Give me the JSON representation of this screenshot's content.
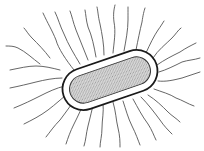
{
  "figure": {
    "subject": "peritrichous bacterium",
    "colors": {
      "background": "#ffffff",
      "outline": "#1a1a1a",
      "flagella": "#555555",
      "cytoplasm_fill": "#cfcfcf",
      "capsule_fill": "#ffffff"
    },
    "cell": {
      "center": [
        110,
        80
      ],
      "rotation_deg": -19,
      "outer_length": 98,
      "outer_width": 42,
      "inner_length": 84,
      "inner_width": 28
    },
    "flagella": [
      "M74 70 C66 60 58 48 56 40 C52 30 48 24 43 13",
      "M80 64 C74 54 68 44 64 34 C60 26 58 18 55 12",
      "M88 60 C84 50 80 40 76 30 C73 22 72 16 70 11",
      "M96 57 C94 46 92 36 88 27 C86 20 86 15 85 10",
      "M104 55 C104 44 102 34 100 24 C98 16 98 11 97 7",
      "M113 53 C114 42 116 32 114 22 C113 14 114 9 115 5",
      "M124 51 C126 40 128 30 128 20 C128 14 128 10 128 7",
      "M136 50 C138 40 140 30 142 22 C143 15 144 11 145 8",
      "M146 53 C150 44 154 36 158 30 C161 26 162 24 164 21",
      "M153 58 C158 50 166 44 172 38 C176 34 178 30 181 28",
      "M157 65 C164 60 172 56 180 52 C186 48 190 46 196 43",
      "M159 72 C166 70 174 66 182 62 C188 60 194 60 200 58",
      "M158 81 C166 82 174 80 182 78 C188 76 194 74 200 72",
      "M154 89 C162 92 170 94 176 98 C182 100 188 104 194 106",
      "M148 95 C156 100 162 106 168 112 C172 116 176 118 180 122",
      "M60 70 C52 68 44 66 36 66 C28 66 20 68 10 70",
      "M62 78 C54 78 44 80 36 82 C28 84 20 86 10 88",
      "M65 86 C56 88 48 92 40 96 C32 100 24 104 14 108",
      "M70 92 C62 98 56 104 48 110 C40 116 32 120 24 124",
      "M77 96 C72 104 66 112 60 120 C54 126 50 132 46 137",
      "M85 99 C82 108 78 116 74 124 C70 132 68 138 66 144",
      "M94 101 C92 110 90 118 88 126 C86 134 86 140 84 146",
      "M103 103 C104 112 102 120 102 128 C102 136 100 142 100 147",
      "M113 102 C116 112 116 120 118 128 C120 136 120 142 120 147",
      "M123 101 C126 110 128 118 132 126 C136 134 138 140 140 145",
      "M133 99 C138 108 142 116 148 124 C152 130 154 136 156 140",
      "M141 97 C148 104 154 112 160 120 C164 126 168 130 172 134",
      "M40 64 C32 58 26 52 18 48 C14 46 10 46 6 46",
      "M50 58 C44 50 38 44 32 38 C28 34 26 30 24 28"
    ]
  }
}
